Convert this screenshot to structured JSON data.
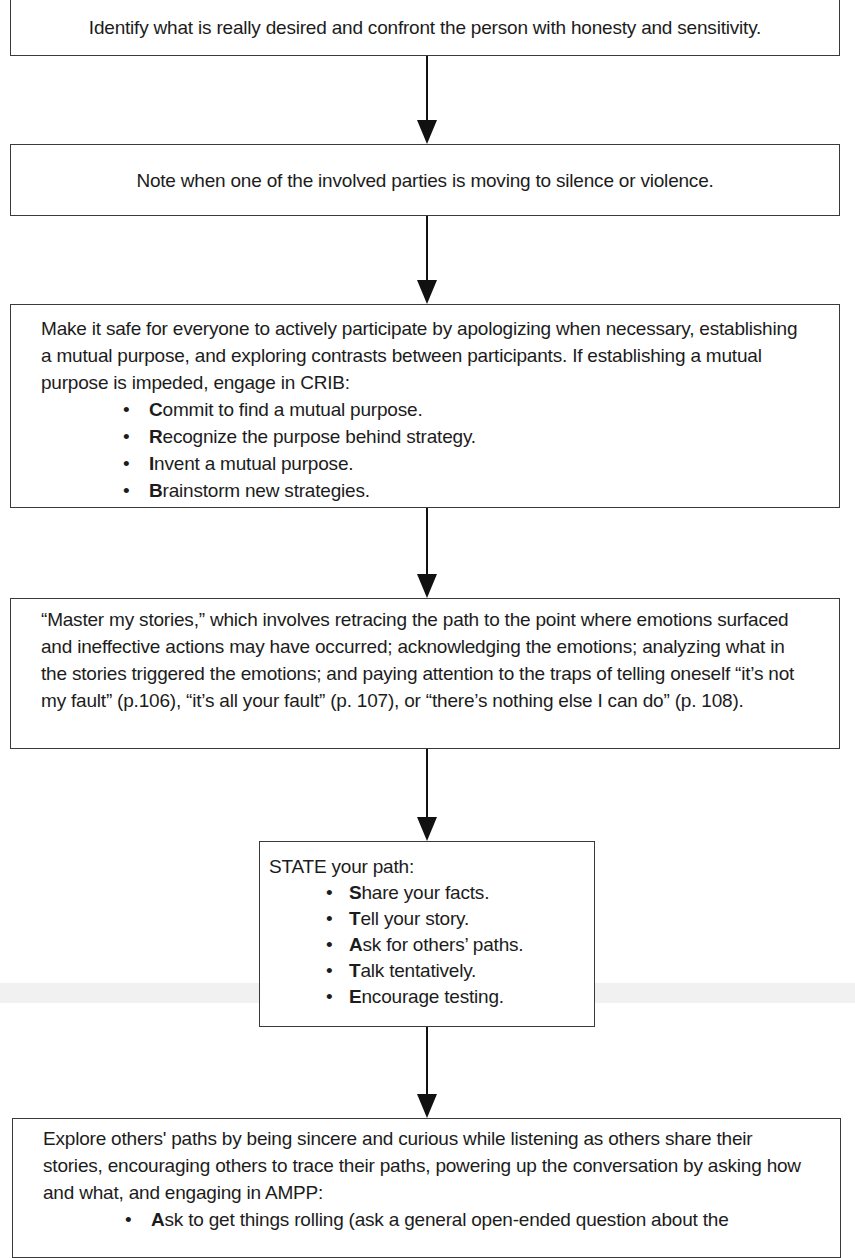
{
  "flowchart": {
    "steps": [
      {
        "id": "step-1",
        "text": "Identify what is really desired and confront the person with honesty and sensitivity."
      },
      {
        "id": "step-2",
        "text": "Note when one of the involved parties is moving to silence or violence."
      },
      {
        "id": "step-3",
        "text": "Make it safe for everyone to actively participate by apologizing when necessary, establishing a mutual purpose, and exploring contrasts between participants. If establishing a mutual purpose is impeded, engage in CRIB:",
        "bullets": [
          {
            "initial": "C",
            "rest": "ommit to find a mutual purpose."
          },
          {
            "initial": "R",
            "rest": "ecognize the purpose behind strategy."
          },
          {
            "initial": "I",
            "rest": "nvent a mutual purpose."
          },
          {
            "initial": "B",
            "rest": "rainstorm new strategies."
          }
        ]
      },
      {
        "id": "step-4",
        "text": "“Master my stories,” which involves retracing the path to the point where emotions surfaced and ineffective actions may have occurred; acknowledging the emotions; analyzing what in the stories triggered the emotions; and paying attention to the traps of telling oneself “it’s not my fault” (p.106), “it’s all your fault” (p. 107), or “there’s nothing else I can do” (p. 108)."
      },
      {
        "id": "step-5",
        "text": "STATE your path:",
        "bullets": [
          {
            "initial": "S",
            "rest": "hare your facts."
          },
          {
            "initial": "T",
            "rest": "ell your story."
          },
          {
            "initial": "A",
            "rest": "sk for others’ paths."
          },
          {
            "initial": "T",
            "rest": "alk tentatively."
          },
          {
            "initial": "E",
            "rest": "ncourage testing."
          }
        ]
      },
      {
        "id": "step-6",
        "text": "Explore others' paths by being sincere and curious while listening as others share their stories, encouraging others to trace their paths, powering up the conversation by asking how and what, and engaging in AMPP:",
        "bullets": [
          {
            "initial": "A",
            "rest": "sk to get things rolling (ask a general open-ended question about the"
          }
        ]
      }
    ],
    "bullet_glyph": "•",
    "colors": {
      "border": "#3a3a3a",
      "arrow": "#111111",
      "text": "#1c1c1c",
      "background": "#ffffff"
    }
  }
}
